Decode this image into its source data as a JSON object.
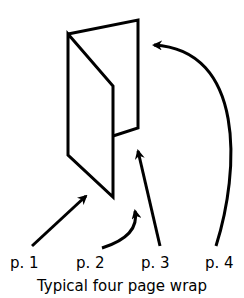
{
  "diagram": {
    "title": "Typical four page wrap",
    "labels": [
      {
        "id": "p1",
        "text": "p. 1"
      },
      {
        "id": "p2",
        "text": "p. 2"
      },
      {
        "id": "p3",
        "text": "p. 3"
      },
      {
        "id": "p4",
        "text": "p. 4"
      }
    ],
    "stroke_color": "#000000",
    "background": "#ffffff"
  }
}
